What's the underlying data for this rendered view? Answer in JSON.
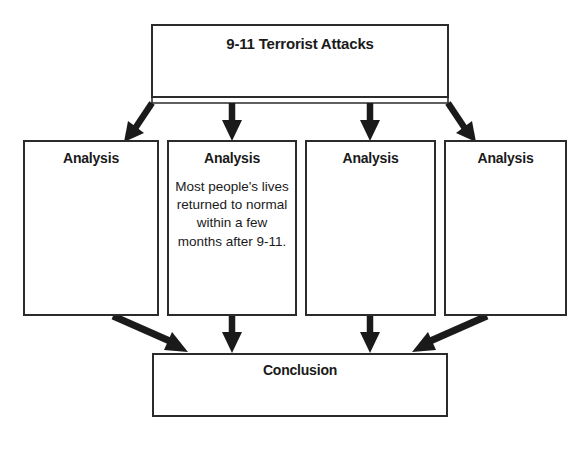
{
  "diagram": {
    "type": "flowchart",
    "title_node": {
      "label": "9-11 Terrorist Attacks",
      "body": ""
    },
    "analysis_nodes": [
      {
        "label": "Analysis",
        "body": ""
      },
      {
        "label": "Analysis",
        "body": "Most people's lives returned to normal within a few months after 9-11."
      },
      {
        "label": "Analysis",
        "body": ""
      },
      {
        "label": "Analysis",
        "body": ""
      }
    ],
    "conclusion_node": {
      "label": "Conclusion",
      "body": ""
    },
    "colors": {
      "border": "#2b2b2b",
      "arrow": "#1a1a1a",
      "background": "#ffffff",
      "text": "#1a1a1a"
    }
  }
}
